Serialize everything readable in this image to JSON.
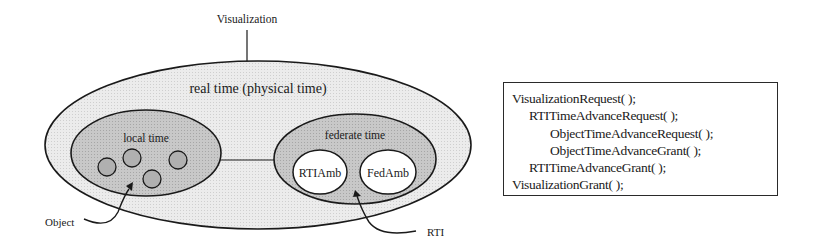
{
  "diagram": {
    "top_label": "Visualization",
    "outer_region": {
      "label": "real time (physical time)",
      "fill": "#e6e6e6"
    },
    "local_region": {
      "label": "local time",
      "fill": "#c2c2c2",
      "objects": [
        {
          "name": "object-1"
        },
        {
          "name": "object-2"
        },
        {
          "name": "object-3"
        },
        {
          "name": "object-4"
        }
      ]
    },
    "federate_region": {
      "label": "federate time",
      "fill": "#c2c2c2",
      "components": [
        {
          "label": "RTIAmb"
        },
        {
          "label": "FedAmb"
        }
      ]
    },
    "callouts": {
      "object": "Object",
      "rti": "RTI"
    }
  },
  "code_box": {
    "lines": [
      {
        "text": "VisualizationRequest( );",
        "indent": 0
      },
      {
        "text": "RTITimeAdvanceRequest( );",
        "indent": 1
      },
      {
        "text": "ObjectTimeAdvanceRequest( );",
        "indent": 2
      },
      {
        "text": "ObjectTimeAdvanceGrant( );",
        "indent": 2
      },
      {
        "text": "RTITimeAdvanceGrant( );",
        "indent": 1
      },
      {
        "text": "VisualizationGrant( );",
        "indent": 0
      }
    ]
  }
}
